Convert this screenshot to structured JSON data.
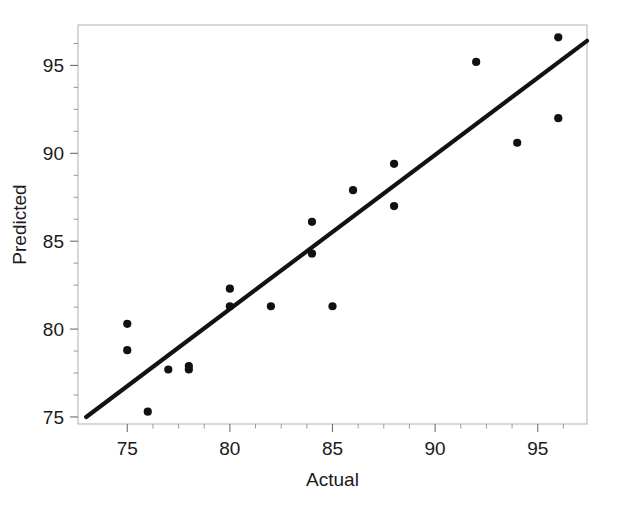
{
  "chart_data": {
    "type": "scatter",
    "title": "",
    "xlabel": "Actual",
    "ylabel": "Predicted",
    "xlim": [
      72.6,
      97.4
    ],
    "ylim": [
      74.6,
      97.3
    ],
    "xticks": [
      75,
      80,
      85,
      90,
      95
    ],
    "yticks": [
      75,
      80,
      85,
      90,
      95
    ],
    "xtick_labels": [
      "75",
      "80",
      "85",
      "90",
      "95"
    ],
    "ytick_labels": [
      "75",
      "80",
      "85",
      "90",
      "95"
    ],
    "x_minor_ticks": [
      76.25,
      77.5,
      78.75,
      81.25,
      82.5,
      83.75,
      86.25,
      87.5,
      88.75,
      91.25,
      92.5,
      93.75,
      96.25
    ],
    "y_minor_ticks": [
      76.25,
      77.5,
      78.75,
      81.25,
      82.5,
      83.75,
      86.25,
      87.5,
      88.75,
      91.25,
      92.5,
      93.75,
      96.25
    ],
    "grid": false,
    "legend": null,
    "marker_color": "#111111",
    "marker_size": 4.1,
    "points": [
      {
        "x": 75.0,
        "y": 80.3
      },
      {
        "x": 75.0,
        "y": 78.8
      },
      {
        "x": 76.0,
        "y": 75.3
      },
      {
        "x": 77.0,
        "y": 77.7
      },
      {
        "x": 78.0,
        "y": 77.9
      },
      {
        "x": 78.0,
        "y": 77.7
      },
      {
        "x": 80.0,
        "y": 82.3
      },
      {
        "x": 80.0,
        "y": 81.3
      },
      {
        "x": 82.0,
        "y": 81.3
      },
      {
        "x": 84.0,
        "y": 86.1
      },
      {
        "x": 84.0,
        "y": 84.3
      },
      {
        "x": 85.0,
        "y": 81.3
      },
      {
        "x": 86.0,
        "y": 87.9
      },
      {
        "x": 88.0,
        "y": 89.4
      },
      {
        "x": 88.0,
        "y": 87.0
      },
      {
        "x": 92.0,
        "y": 95.2
      },
      {
        "x": 94.0,
        "y": 90.6
      },
      {
        "x": 96.0,
        "y": 96.6
      },
      {
        "x": 96.0,
        "y": 92.0
      }
    ],
    "fit_line": {
      "color": "#121212",
      "width": 4.2,
      "x_start": 73.0,
      "y_start": 75.0,
      "x_end": 97.4,
      "y_end": 96.4
    }
  }
}
